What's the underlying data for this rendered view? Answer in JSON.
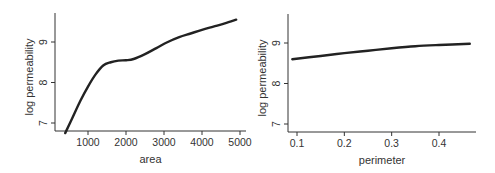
{
  "chart_data": [
    {
      "type": "line",
      "title": "",
      "xlabel": "area",
      "ylabel": "log permeability",
      "xlim": [
        150,
        5000
      ],
      "ylim": [
        6.75,
        9.7
      ],
      "xticks": [
        1000,
        2000,
        3000,
        4000,
        5000
      ],
      "xtick_labels": [
        "1000",
        "2000",
        "3000",
        "4000",
        "5000"
      ],
      "yticks": [
        7,
        8,
        9
      ],
      "ytick_labels": [
        "7",
        "8",
        "9"
      ],
      "grid": false,
      "series": [
        {
          "name": "smooth fit",
          "x": [
            400,
            600,
            800,
            1000,
            1200,
            1400,
            1600,
            1800,
            2000,
            2200,
            2500,
            2800,
            3100,
            3400,
            3700,
            4000,
            4300,
            4600,
            4900
          ],
          "y": [
            6.75,
            7.15,
            7.55,
            7.9,
            8.2,
            8.42,
            8.5,
            8.54,
            8.55,
            8.58,
            8.7,
            8.85,
            9.0,
            9.12,
            9.21,
            9.3,
            9.38,
            9.46,
            9.55
          ]
        }
      ]
    },
    {
      "type": "line",
      "title": "",
      "xlabel": "perimeter",
      "ylabel": "log permeability",
      "xlim": [
        0.07,
        0.49
      ],
      "ylim": [
        6.75,
        9.7
      ],
      "xticks": [
        0.1,
        0.2,
        0.3,
        0.4
      ],
      "xtick_labels": [
        "0.1",
        "0.2",
        "0.3",
        "0.4"
      ],
      "yticks": [
        7,
        8,
        9
      ],
      "ytick_labels": [
        "7",
        "8",
        "9"
      ],
      "grid": false,
      "series": [
        {
          "name": "smooth fit",
          "x": [
            0.09,
            0.15,
            0.2,
            0.25,
            0.3,
            0.35,
            0.4,
            0.465
          ],
          "y": [
            8.6,
            8.68,
            8.75,
            8.81,
            8.87,
            8.92,
            8.95,
            8.98
          ]
        }
      ]
    }
  ]
}
